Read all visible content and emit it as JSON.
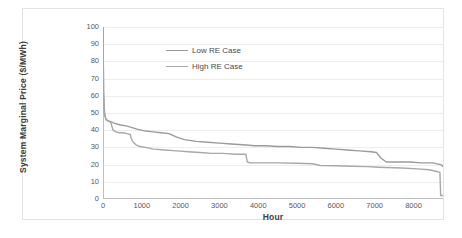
{
  "chart_data": {
    "type": "line",
    "title": "",
    "xlabel": "Hour",
    "ylabel": "System Marginal Price ($/MWh)",
    "xlim": [
      0,
      8760
    ],
    "ylim": [
      0,
      100
    ],
    "xticks": [
      0,
      1000,
      2000,
      3000,
      4000,
      5000,
      6000,
      7000,
      8000
    ],
    "yticks": [
      0,
      10,
      20,
      30,
      40,
      50,
      60,
      70,
      80,
      90,
      100
    ],
    "grid": "horizontal",
    "legend_position": "upper-center-left",
    "series": [
      {
        "name": "Low RE Case",
        "color": "#9a9a9a",
        "x": [
          0,
          15,
          40,
          80,
          130,
          200,
          300,
          450,
          600,
          750,
          900,
          1100,
          1300,
          1500,
          1700,
          1900,
          2100,
          2400,
          2700,
          3000,
          3300,
          3600,
          3900,
          4200,
          4500,
          4800,
          5100,
          5400,
          5700,
          6000,
          6300,
          6600,
          6900,
          7050,
          7150,
          7300,
          7600,
          7900,
          8200,
          8500,
          8700,
          8760
        ],
        "y": [
          100,
          62,
          50,
          46,
          45.5,
          45,
          44,
          43,
          42.5,
          41.5,
          40.5,
          39.5,
          39,
          38.5,
          38,
          36,
          34.5,
          33.5,
          33,
          32.5,
          32,
          31.5,
          31,
          31,
          30.5,
          30.5,
          30,
          30,
          29.5,
          29,
          28.5,
          28,
          27.5,
          27,
          24,
          21.5,
          21.5,
          21.5,
          21,
          21,
          20,
          19
        ]
      },
      {
        "name": "High RE Case",
        "color": "#a8a8a8",
        "x": [
          0,
          15,
          40,
          80,
          130,
          200,
          260,
          330,
          420,
          520,
          620,
          700,
          730,
          780,
          850,
          950,
          1100,
          1300,
          1600,
          1900,
          2200,
          2500,
          2800,
          3100,
          3400,
          3600,
          3680,
          3720,
          3800,
          4100,
          4500,
          5000,
          5400,
          5600,
          6000,
          6400,
          6800,
          7100,
          7300,
          7700,
          8100,
          8400,
          8600,
          8680,
          8700,
          8760
        ],
        "y": [
          100,
          60,
          49,
          46,
          45.5,
          44.5,
          40,
          39,
          38.5,
          38.5,
          38,
          37.5,
          35,
          33,
          31.5,
          30.5,
          30,
          29,
          28.5,
          28,
          27.5,
          27,
          26.5,
          26.5,
          26,
          26,
          26,
          21.5,
          21,
          21,
          21,
          20.8,
          20.5,
          19.5,
          19.3,
          19,
          18.8,
          18.5,
          18.3,
          18,
          17.5,
          17,
          16,
          15.5,
          2,
          2
        ]
      }
    ]
  },
  "legend": {
    "items": [
      {
        "label": "Low RE Case"
      },
      {
        "label": "High RE Case"
      }
    ]
  }
}
